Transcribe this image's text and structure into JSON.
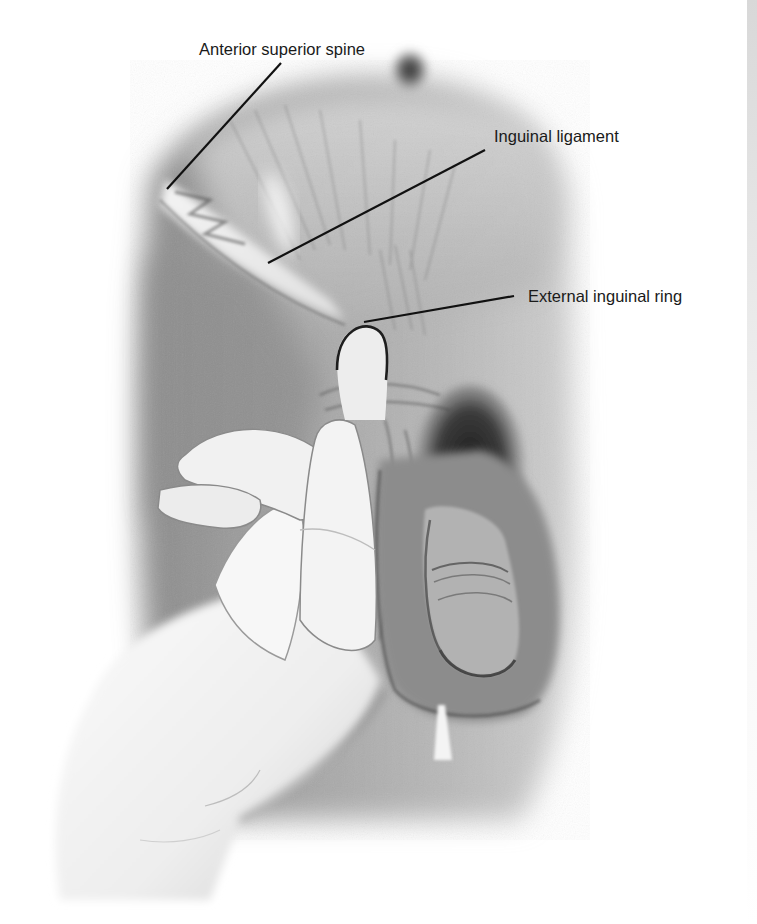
{
  "figure": {
    "palette": {
      "background": "#ffffff",
      "skin_mid": "#9a9a9a",
      "skin_dark": "#6e6e6e",
      "glove": "#f2f2f2",
      "line": "#111111",
      "text": "#1a1a1a"
    },
    "labels": [
      {
        "id": "anterior-superior-spine",
        "text": "Anterior superior spine",
        "x": 199,
        "y": 41,
        "line": {
          "x1": 281,
          "y1": 63,
          "x2": 167,
          "y2": 189
        }
      },
      {
        "id": "inguinal-ligament",
        "text": "Inguinal ligament",
        "x": 494,
        "y": 128,
        "line": {
          "x1": 485,
          "y1": 150,
          "x2": 268,
          "y2": 263
        }
      },
      {
        "id": "external-inguinal-ring",
        "text": "External inguinal ring",
        "x": 528,
        "y": 288,
        "line": {
          "x1": 514,
          "y1": 296,
          "x2": 364,
          "y2": 322
        }
      }
    ]
  }
}
